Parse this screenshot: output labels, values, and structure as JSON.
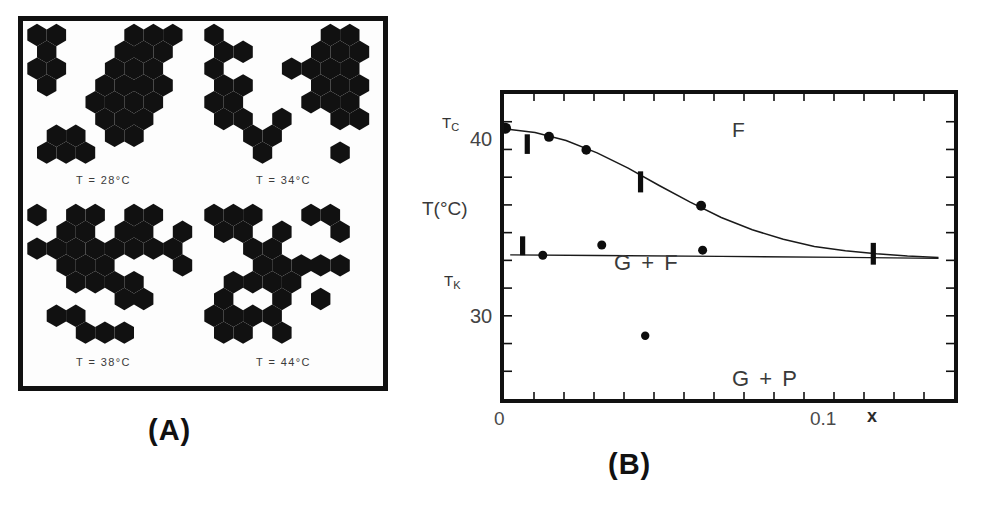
{
  "figure": {
    "panel_a": {
      "letter": "(A)",
      "quadrants": [
        {
          "caption": "T = 28°C",
          "temperature_c": 28
        },
        {
          "caption": "T = 34°C",
          "temperature_c": 34
        },
        {
          "caption": "T = 38°C",
          "temperature_c": 38
        },
        {
          "caption": "T = 44°C",
          "temperature_c": 44
        }
      ]
    },
    "panel_b": {
      "letter": "(B)"
    }
  },
  "chart_data": {
    "type": "scatter",
    "title": "",
    "xlabel": "x",
    "ylabel": "T(°C)",
    "xlim": [
      0,
      0.145
    ],
    "ylim": [
      22.5,
      43.5
    ],
    "grid": false,
    "legend_position": "none",
    "x_ticks": [
      {
        "value": 0,
        "label": "0"
      },
      {
        "value": 0.1,
        "label": "0.1"
      }
    ],
    "y_ticks": [
      {
        "value": 40,
        "label": "40"
      },
      {
        "value": 30,
        "label": "30"
      }
    ],
    "axis_annotations": [
      {
        "text": "T_C",
        "display": "T",
        "sub": "C",
        "value": 41.2
      },
      {
        "text": "T_K",
        "display": "T",
        "sub": "K",
        "value": 32.4
      }
    ],
    "region_labels": [
      {
        "text": "F",
        "x": 0.062,
        "y": 42.3
      },
      {
        "text": "G + F",
        "x": 0.017,
        "y": 35.6
      },
      {
        "text": "G + P",
        "x": 0.061,
        "y": 27.0
      }
    ],
    "series": [
      {
        "name": "T_C curve (Curie temperature)",
        "type": "line",
        "points": [
          {
            "x": 0.0,
            "y": 41.1
          },
          {
            "x": 0.01,
            "y": 40.85
          },
          {
            "x": 0.02,
            "y": 40.3
          },
          {
            "x": 0.03,
            "y": 39.45
          },
          {
            "x": 0.04,
            "y": 38.4
          },
          {
            "x": 0.05,
            "y": 37.2
          },
          {
            "x": 0.06,
            "y": 36.05
          },
          {
            "x": 0.07,
            "y": 35.0
          },
          {
            "x": 0.08,
            "y": 34.15
          },
          {
            "x": 0.09,
            "y": 33.5
          },
          {
            "x": 0.1,
            "y": 33.0
          },
          {
            "x": 0.11,
            "y": 32.7
          },
          {
            "x": 0.12,
            "y": 32.5
          },
          {
            "x": 0.13,
            "y": 32.35
          },
          {
            "x": 0.14,
            "y": 32.25
          }
        ]
      },
      {
        "name": "T_K line (structural transition)",
        "type": "line",
        "points": [
          {
            "x": 0.002,
            "y": 32.42
          },
          {
            "x": 0.03,
            "y": 32.38
          },
          {
            "x": 0.07,
            "y": 32.32
          },
          {
            "x": 0.11,
            "y": 32.25
          },
          {
            "x": 0.14,
            "y": 32.18
          }
        ]
      }
    ],
    "markers": {
      "circles": [
        {
          "x": 0.0005,
          "y": 41.15,
          "r": 5.5,
          "note": "on T_C curve at x=0"
        },
        {
          "x": 0.0145,
          "y": 40.55,
          "r": 5.0,
          "note": "on T_C curve"
        },
        {
          "x": 0.0265,
          "y": 39.65,
          "r": 4.8,
          "note": "on T_C curve"
        },
        {
          "x": 0.0635,
          "y": 35.8,
          "r": 5.0,
          "note": "on T_C curve"
        },
        {
          "x": 0.0125,
          "y": 32.4,
          "r": 4.5,
          "note": "on T_K line"
        },
        {
          "x": 0.0315,
          "y": 33.1,
          "r": 4.5,
          "note": "above T_K line"
        },
        {
          "x": 0.064,
          "y": 32.75,
          "r": 4.5,
          "note": "above T_K line"
        },
        {
          "x": 0.0455,
          "y": 26.85,
          "r": 4.2,
          "note": "in G + P region"
        }
      ],
      "bars": [
        {
          "x": 0.0075,
          "y": 40.05,
          "height": 1.35,
          "note": "error bar near T_C axis"
        },
        {
          "x": 0.044,
          "y": 37.45,
          "height": 1.45,
          "note": "error bar on T_C curve"
        },
        {
          "x": 0.119,
          "y": 32.5,
          "height": 1.5,
          "note": "error bar at curve convergence"
        },
        {
          "x": 0.006,
          "y": 33.05,
          "height": 1.3,
          "note": "error bar near T_K"
        }
      ]
    }
  }
}
